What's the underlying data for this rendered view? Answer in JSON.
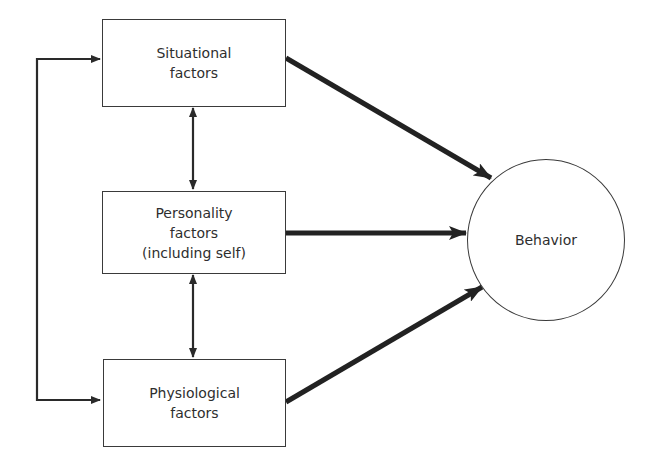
{
  "diagram": {
    "type": "flow-diagram",
    "nodes": {
      "situational": {
        "shape": "rectangle",
        "lines": [
          "Situational",
          "factors"
        ]
      },
      "personality": {
        "shape": "rectangle",
        "lines": [
          "Personality",
          "factors",
          "(including self)"
        ]
      },
      "physiological": {
        "shape": "rectangle",
        "lines": [
          "Physiological",
          "factors"
        ]
      },
      "behavior": {
        "shape": "circle",
        "label": "Behavior"
      }
    },
    "edges": [
      {
        "from": "situational",
        "to": "behavior",
        "style": "thick",
        "direction": "forward"
      },
      {
        "from": "personality",
        "to": "behavior",
        "style": "thick",
        "direction": "forward"
      },
      {
        "from": "physiological",
        "to": "behavior",
        "style": "thick",
        "direction": "forward"
      },
      {
        "from": "situational",
        "to": "personality",
        "style": "thin",
        "direction": "bidirectional"
      },
      {
        "from": "personality",
        "to": "physiological",
        "style": "thin",
        "direction": "bidirectional"
      },
      {
        "from": "situational",
        "to": "physiological",
        "style": "thin",
        "direction": "bidirectional",
        "routing": "left-loop"
      }
    ],
    "colors": {
      "stroke": "#2a2a2a",
      "background": "#ffffff",
      "text": "#2e2e2e"
    }
  }
}
